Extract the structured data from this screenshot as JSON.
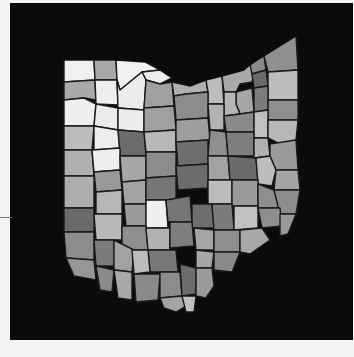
{
  "map": {
    "region": "Ohio",
    "type": "county choropleth",
    "background_color": "#0b0b0b",
    "page_color": "#f4f4f4",
    "border_color": "#1a1a1a",
    "shades": {
      "white": "#f2f2f2",
      "very_light": "#d9d9d9",
      "light": "#bdbdbd",
      "medium_light": "#a6a6a6",
      "medium": "#8c8c8c",
      "medium_dark": "#747474",
      "dark": "#5c5c5c"
    },
    "counties": [
      {
        "id": "williams",
        "points": "64,60 94,60 95,80 64,82",
        "shade": "#f0f0f0"
      },
      {
        "id": "fulton",
        "points": "94,60 116,60 117,80 95,80",
        "shade": "#a8a8a8"
      },
      {
        "id": "lucas",
        "points": "116,60 145,62 160,70 142,72 120,90 117,80",
        "shade": "#f0f0f0"
      },
      {
        "id": "ottawa",
        "points": "142,72 160,70 172,78 160,84 146,80",
        "shade": "#eeeeee"
      },
      {
        "id": "defiance",
        "points": "64,82 95,80 96,100 84,98 64,100",
        "shade": "#a9a9a9"
      },
      {
        "id": "henry",
        "points": "95,80 117,80 118,105 96,104",
        "shade": "#eeeeee"
      },
      {
        "id": "wood",
        "points": "117,80 120,90 142,72 146,80 144,110 118,108",
        "shade": "#ececec"
      },
      {
        "id": "sandusky",
        "points": "146,80 160,84 172,82 174,106 144,108",
        "shade": "#a0a0a0"
      },
      {
        "id": "erie",
        "points": "172,82 190,86 206,80 208,92 186,94 174,96",
        "shade": "#b0b0b0"
      },
      {
        "id": "lorain",
        "points": "206,80 222,76 224,104 208,104 208,92",
        "shade": "#bcbcbc"
      },
      {
        "id": "cuyahoga",
        "points": "222,76 244,70 250,64 256,66 252,82 240,84 236,92 224,92",
        "shade": "#a9a9a9"
      },
      {
        "id": "lake",
        "points": "250,64 264,56 266,70 252,74",
        "shade": "#8a8a8a"
      },
      {
        "id": "geauga",
        "points": "252,74 266,70 268,86 254,88",
        "shade": "#6a6a6a"
      },
      {
        "id": "ashtabula",
        "points": "264,56 296,36 298,70 268,72",
        "shade": "#909090"
      },
      {
        "id": "trumbull",
        "points": "268,72 298,70 298,100 268,100",
        "shade": "#bcbcbc"
      },
      {
        "id": "portage",
        "points": "254,88 268,86 268,110 254,112",
        "shade": "#7c7c7c"
      },
      {
        "id": "summit",
        "points": "236,92 252,88 254,112 240,114 236,104",
        "shade": "#a6a6a6"
      },
      {
        "id": "medina",
        "points": "224,92 236,92 236,104 240,114 224,116",
        "shade": "#b6b6b6"
      },
      {
        "id": "mahoning",
        "points": "268,100 298,100 298,120 268,120",
        "shade": "#8e8e8e"
      },
      {
        "id": "paulding",
        "points": "64,100 84,98 96,104 94,126 64,126",
        "shade": "#efefef"
      },
      {
        "id": "putnam",
        "points": "96,104 118,108 118,130 94,126",
        "shade": "#ebebeb"
      },
      {
        "id": "hancock",
        "points": "118,108 144,110 144,132 118,130",
        "shade": "#ececec"
      },
      {
        "id": "seneca",
        "points": "144,108 174,106 176,130 144,132",
        "shade": "#a0a0a0"
      },
      {
        "id": "huron",
        "points": "174,96 186,94 208,92 208,118 176,120",
        "shade": "#8c8c8c"
      },
      {
        "id": "ashland",
        "points": "208,104 224,104 224,130 210,130",
        "shade": "#b2b2b2"
      },
      {
        "id": "wayne",
        "points": "224,116 240,114 254,112 254,132 226,132",
        "shade": "#8a8a8a"
      },
      {
        "id": "stark",
        "points": "254,112 268,110 268,138 254,138",
        "shade": "#c0c0c0"
      },
      {
        "id": "columbiana",
        "points": "268,120 298,120 296,140 280,144 268,138",
        "shade": "#b6b6b6"
      },
      {
        "id": "vanwert",
        "points": "64,126 94,126 92,150 64,150",
        "shade": "#bcbcbc"
      },
      {
        "id": "allen",
        "points": "94,126 118,130 120,148 94,150",
        "shade": "#ededed"
      },
      {
        "id": "hardin",
        "points": "118,130 144,132 146,156 120,156",
        "shade": "#6c6c6c"
      },
      {
        "id": "wyandot",
        "points": "144,132 176,130 176,152 146,152",
        "shade": "#b8b8b8"
      },
      {
        "id": "crawford",
        "points": "176,120 208,118 210,140 176,142",
        "shade": "#9e9e9e"
      },
      {
        "id": "richland",
        "points": "210,130 226,132 228,156 208,156",
        "shade": "#8e8e8e"
      },
      {
        "id": "holmes",
        "points": "226,132 254,132 254,156 228,156",
        "shade": "#7e7e7e"
      },
      {
        "id": "carroll",
        "points": "254,138 268,138 270,156 254,158",
        "shade": "#b0b0b0"
      },
      {
        "id": "jefferson",
        "points": "270,144 296,140 298,170 276,170 270,156",
        "shade": "#9a9a9a"
      },
      {
        "id": "mercer",
        "points": "64,150 92,150 94,176 64,176",
        "shade": "#b0b0b0"
      },
      {
        "id": "auglaize",
        "points": "92,150 120,148 120,170 94,172",
        "shade": "#efefef"
      },
      {
        "id": "logan",
        "points": "120,156 146,156 146,180 122,182",
        "shade": "#a6a6a6"
      },
      {
        "id": "marion",
        "points": "146,152 176,152 176,176 146,178",
        "shade": "#8c8c8c"
      },
      {
        "id": "morrow",
        "points": "176,142 208,140 208,164 178,166",
        "shade": "#6e6e6e"
      },
      {
        "id": "knox",
        "points": "208,156 228,156 230,180 208,180",
        "shade": "#a2a2a2"
      },
      {
        "id": "coshocton",
        "points": "228,156 256,158 258,180 230,180",
        "shade": "#6a6a6a"
      },
      {
        "id": "tuscarawas",
        "points": "256,158 270,156 276,170 272,186 258,184",
        "shade": "#bcbcbc"
      },
      {
        "id": "harrison",
        "points": "276,170 298,170 300,190 274,190",
        "shade": "#a4a4a4"
      },
      {
        "id": "darke",
        "points": "64,176 94,176 94,208 64,208",
        "shade": "#aeaeae"
      },
      {
        "id": "shelby",
        "points": "94,172 120,170 122,190 96,192",
        "shade": "#999999"
      },
      {
        "id": "champaign",
        "points": "122,182 146,180 146,204 124,204",
        "shade": "#a4a4a4"
      },
      {
        "id": "union",
        "points": "146,178 176,176 176,200 146,200",
        "shade": "#767676"
      },
      {
        "id": "delaware",
        "points": "176,166 208,164 208,188 178,190",
        "shade": "#6c6c6c"
      },
      {
        "id": "licking",
        "points": "208,180 232,180 232,204 208,204",
        "shade": "#bcbcbc"
      },
      {
        "id": "muskingum",
        "points": "232,180 258,180 258,206 232,206",
        "shade": "#9a9a9a"
      },
      {
        "id": "guernsey",
        "points": "258,184 274,190 280,208 258,208",
        "shade": "#8e8e8e"
      },
      {
        "id": "belmont",
        "points": "274,190 300,190 296,214 280,214",
        "shade": "#8c8c8c"
      },
      {
        "id": "preble",
        "points": "64,208 94,208 94,232 64,232",
        "shade": "#6a6a6a"
      },
      {
        "id": "miami",
        "points": "96,192 122,190 122,214 96,214",
        "shade": "#b6b6b6"
      },
      {
        "id": "clark",
        "points": "124,204 146,204 146,226 126,226",
        "shade": "#9a9a9a"
      },
      {
        "id": "madison",
        "points": "146,200 166,200 168,228 146,228",
        "shade": "#efefef"
      },
      {
        "id": "franklin",
        "points": "166,200 190,196 192,222 168,222",
        "shade": "#767676"
      },
      {
        "id": "fairfield",
        "points": "192,204 212,204 214,228 192,228",
        "shade": "#6e6e6e"
      },
      {
        "id": "perry",
        "points": "212,204 232,204 234,230 214,230",
        "shade": "#7c7c7c"
      },
      {
        "id": "morgan",
        "points": "234,206 258,206 258,228 234,230",
        "shade": "#c0c0c0"
      },
      {
        "id": "noble",
        "points": "258,208 280,208 282,226 262,228",
        "shade": "#8e8e8e"
      },
      {
        "id": "monroe",
        "points": "280,214 296,214 288,234 280,236",
        "shade": "#9a9a9a"
      },
      {
        "id": "butler",
        "points": "64,232 94,232 94,260 66,258",
        "shade": "#8c8c8c"
      },
      {
        "id": "montgomery",
        "points": "94,214 122,214 122,240 96,240",
        "shade": "#b8b8b8"
      },
      {
        "id": "greene",
        "points": "122,226 146,226 148,250 122,250",
        "shade": "#8e8e8e"
      },
      {
        "id": "fayette",
        "points": "146,228 170,228 170,250 148,250",
        "shade": "#b2b2b2"
      },
      {
        "id": "pickaway",
        "points": "170,222 192,222 194,246 170,248",
        "shade": "#7e7e7e"
      },
      {
        "id": "hocking",
        "points": "194,228 214,230 214,250 196,250",
        "shade": "#a6a6a6"
      },
      {
        "id": "athens",
        "points": "214,230 240,230 240,252 214,252",
        "shade": "#8e8e8e"
      },
      {
        "id": "washington",
        "points": "240,230 262,228 270,240 250,254 240,252",
        "shade": "#a8a8a8"
      },
      {
        "id": "hamilton",
        "points": "66,258 94,260 96,280 74,276",
        "shade": "#969696"
      },
      {
        "id": "warren",
        "points": "94,240 114,240 114,266 96,266",
        "shade": "#7c7c7c"
      },
      {
        "id": "clinton",
        "points": "114,240 134,250 132,272 114,270",
        "shade": "#a2a2a2"
      },
      {
        "id": "ross",
        "points": "148,250 176,250 178,272 150,272",
        "shade": "#787878"
      },
      {
        "id": "vinton",
        "points": "196,250 214,252 212,268 196,268",
        "shade": "#a6a6a6"
      },
      {
        "id": "meigs",
        "points": "214,252 240,252 232,272 214,270",
        "shade": "#8a8a8a"
      },
      {
        "id": "clermont",
        "points": "96,266 114,270 112,292 100,290",
        "shade": "#8a8a8a"
      },
      {
        "id": "brown",
        "points": "114,270 132,272 132,300 118,298",
        "shade": "#a8a8a8"
      },
      {
        "id": "highland",
        "points": "132,250 148,250 150,272 134,274",
        "shade": "#bbbbbb"
      },
      {
        "id": "adams",
        "points": "134,274 160,274 158,300 136,302",
        "shade": "#8a8a8a"
      },
      {
        "id": "pike",
        "points": "160,272 180,272 182,296 160,298",
        "shade": "#8c8c8c"
      },
      {
        "id": "jackson",
        "points": "180,264 196,268 196,294 182,296",
        "shade": "#6c6c6c"
      },
      {
        "id": "gallia",
        "points": "196,268 212,268 214,286 206,298 196,296",
        "shade": "#9a9a9a"
      },
      {
        "id": "scioto",
        "points": "160,298 182,296 186,306 176,312 164,308",
        "shade": "#a4a4a4"
      },
      {
        "id": "lawrence",
        "points": "182,296 196,296 194,312 186,312",
        "shade": "#c0c0c0"
      }
    ],
    "lake_erie": {
      "points": "10,3 353,3 353,32 296,36 264,56 244,70 222,76 206,80 190,86 172,78 160,70 145,62 116,60 64,60 64,3"
    },
    "ohio_river_mask": {
      "points": "64,232 66,258 74,276 96,280 100,290 112,292 118,298 136,302 158,300 164,308 176,312 186,312 194,312 206,298 214,286 232,272 240,252 250,254 270,240 282,226 288,234 296,214 300,190 298,170 296,140 298,100 298,70 296,36 353,32 353,340 10,340 10,3 64,3 64,232"
    }
  }
}
